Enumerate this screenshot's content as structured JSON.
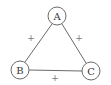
{
  "diagram": {
    "type": "signed-graph-triangle",
    "colors": {
      "stroke": "#6a6a6a",
      "label": "#333333",
      "sign": "#777777",
      "background": "#ffffff"
    },
    "nodes": [
      {
        "id": "A",
        "label": "A",
        "x": 57,
        "y": 16,
        "r": 9
      },
      {
        "id": "B",
        "label": "B",
        "x": 20,
        "y": 70,
        "r": 9
      },
      {
        "id": "C",
        "label": "C",
        "x": 91,
        "y": 71,
        "r": 9
      }
    ],
    "edges": [
      {
        "from": "A",
        "to": "B",
        "sign": "+",
        "label_x": 31,
        "label_y": 38
      },
      {
        "from": "A",
        "to": "C",
        "sign": "+",
        "label_x": 79,
        "label_y": 38
      },
      {
        "from": "B",
        "to": "C",
        "sign": "+",
        "label_x": 55,
        "label_y": 78
      }
    ]
  }
}
